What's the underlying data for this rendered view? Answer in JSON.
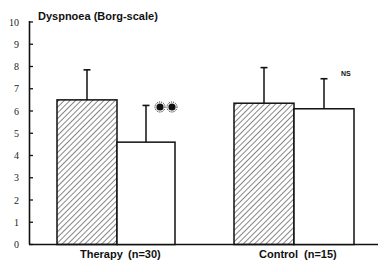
{
  "chart_data": {
    "type": "bar",
    "title": "Dyspnoea (Borg-scale)",
    "xlabel": "",
    "ylabel": "Dyspnoea (Borg-scale)",
    "ylim": [
      0,
      10
    ],
    "yticks": [
      0,
      1,
      2,
      3,
      4,
      5,
      6,
      7,
      8,
      9,
      10
    ],
    "grid": false,
    "categories": [
      "Therapy (n=30)",
      "Control (n=15)"
    ],
    "series": [
      {
        "name": "Before (hatched)",
        "pattern": "hatched",
        "values": [
          6.5,
          6.35
        ],
        "error_upper": [
          7.85,
          7.95
        ]
      },
      {
        "name": "After (open)",
        "pattern": "open",
        "values": [
          4.6,
          6.1
        ],
        "error_upper": [
          6.25,
          7.45
        ]
      }
    ],
    "annotations": [
      {
        "group": "Therapy (n=30)",
        "text": "**",
        "meaning": "significant"
      },
      {
        "group": "Control (n=15)",
        "text": "NS"
      }
    ]
  },
  "labels": {
    "title": "Dyspnoea (Borg-scale)",
    "therapy": "Therapy",
    "therapy_n": "(n=30)",
    "control": "Control",
    "control_n": "(n=15)",
    "ns": "NS",
    "ticks": [
      "0",
      "1",
      "2",
      "3",
      "4",
      "5",
      "6",
      "7",
      "8",
      "9",
      "10"
    ]
  },
  "colors": {
    "ink": "#111111",
    "background": "#ffffff"
  }
}
